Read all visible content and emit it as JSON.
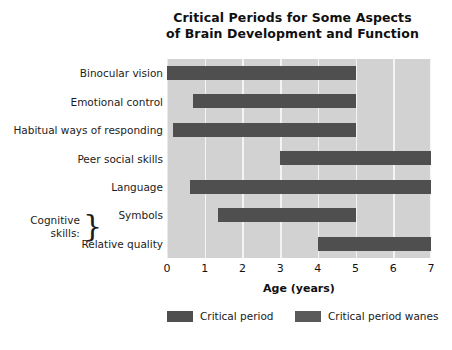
{
  "chart_data": {
    "type": "bar",
    "orientation": "horizontal",
    "title": "Critical Periods for Some Aspects of Brain Development and Function",
    "title_lines": [
      "Critical Periods for Some Aspects",
      "of Brain Development and Function"
    ],
    "xlabel": "Age  (years)",
    "ylabel": "",
    "xlim": [
      0,
      7
    ],
    "xticks": [
      0,
      1,
      2,
      3,
      4,
      5,
      6,
      7
    ],
    "xtick_labels": [
      "0",
      "1",
      "2",
      "3",
      "4",
      "5",
      "6",
      "7"
    ],
    "grid": "vertical",
    "legend_position": "bottom",
    "categories": [
      "Binocular vision",
      "Emotional control",
      "Habitual ways of responding",
      "Peer social skills",
      "Language",
      "Symbols",
      "Relative quality"
    ],
    "bars": [
      {
        "category": "Binocular vision",
        "start": 0.0,
        "end": 5.0
      },
      {
        "category": "Emotional control",
        "start": 0.7,
        "end": 5.0
      },
      {
        "category": "Habitual ways of responding",
        "start": 0.15,
        "end": 5.0
      },
      {
        "category": "Peer social skills",
        "start": 3.0,
        "end": 7.0
      },
      {
        "category": "Language",
        "start": 0.6,
        "end": 7.0
      },
      {
        "category": "Symbols",
        "start": 1.35,
        "end": 5.0
      },
      {
        "category": "Relative quality",
        "start": 4.0,
        "end": 7.0
      }
    ],
    "series": [
      {
        "name": "Critical period",
        "color": "#4f4f4f",
        "values": [
          5.0,
          4.3,
          4.85,
          4.0,
          6.4,
          3.65,
          3.0
        ]
      }
    ],
    "annotations": [
      {
        "name": "cognitive-skills-bracket",
        "text_lines": [
          "Cognitive",
          "skills:"
        ],
        "brace": "}",
        "covers": [
          "Symbols",
          "Relative quality"
        ]
      }
    ],
    "legend": [
      {
        "label": "Critical period",
        "color": "#4f4f4f"
      },
      {
        "label": "Critical period wanes",
        "color": "#5a5a5a"
      }
    ],
    "colors": {
      "plot_background": "#d2d2d2",
      "gridline": "#f4f4f4",
      "bar": "#4f4f4f",
      "bar_wanes": "#5a5a5a",
      "text": "#1a1a1a",
      "page_background": "#ffffff"
    }
  }
}
